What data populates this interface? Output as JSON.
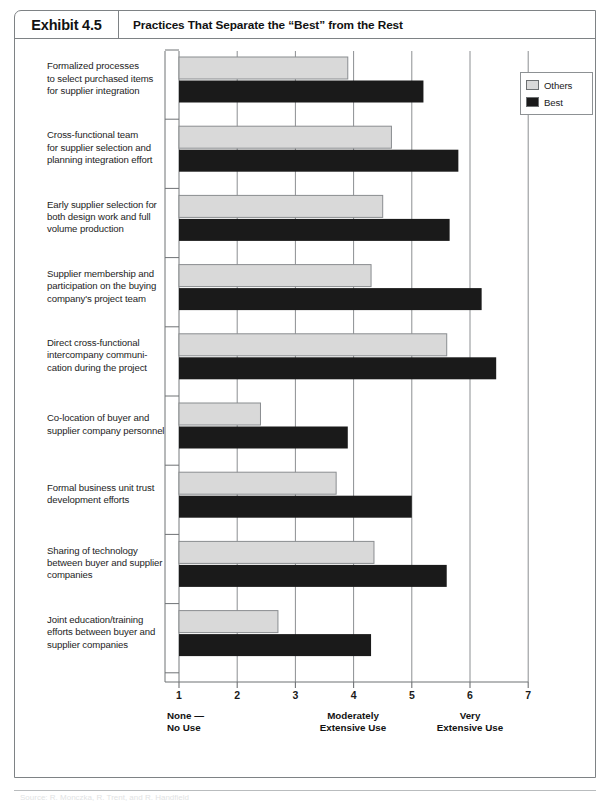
{
  "exhibit": {
    "number": "Exhibit 4.5",
    "title": "Practices That Separate the “Best” from the Rest"
  },
  "legend": {
    "items": [
      {
        "label": "Others",
        "color": "#d9d9d9"
      },
      {
        "label": "Best",
        "color": "#1a1a1a"
      }
    ]
  },
  "axis_captions": {
    "left": "None —\nNo Use",
    "center": "Moderately\nExtensive Use",
    "right": "Very\nExtensive Use"
  },
  "source": {
    "text": "Source: R. Monczka, R. Trent, and R. Handfield"
  },
  "colors": {
    "others": "#d9d9d9",
    "best": "#1a1a1a",
    "grid": "#8c8f92",
    "axis": "#6f7275",
    "frame": "#7e8285"
  },
  "chart_data": {
    "type": "bar",
    "orientation": "horizontal",
    "title": "Practices That Separate the “Best” from the Rest",
    "xlabel": "",
    "ylabel": "",
    "xlim": [
      1,
      7
    ],
    "xticks": [
      1,
      2,
      3,
      4,
      5,
      6,
      7
    ],
    "xtick_labels": [
      "1",
      "2",
      "3",
      "4",
      "5",
      "6",
      "7"
    ],
    "grid": true,
    "legend_position": "top-right",
    "categories": [
      "Formalized processes to select purchased items for supplier integration",
      "Cross-functional team for supplier selection and planning integration effort",
      "Early supplier selection for both design work and full volume production",
      "Supplier membership and participation on the buying company's project team",
      "Direct cross-functional intercompany communication during the project",
      "Co-location of buyer and supplier company personnel",
      "Formal business unit trust development efforts",
      "Sharing of technology between buyer and supplier companies",
      "Joint education/training efforts between buyer and supplier companies"
    ],
    "category_lines": [
      [
        "Formalized processes",
        "to select purchased items",
        "for supplier integration"
      ],
      [
        "Cross-functional team",
        "for supplier selection and",
        "planning integration effort"
      ],
      [
        "Early supplier selection for",
        "both design work and full",
        "volume production"
      ],
      [
        "Supplier membership and",
        "participation on the buying",
        "company's project team"
      ],
      [
        "Direct cross-functional",
        "intercompany communi-",
        "cation during the project"
      ],
      [
        "Co-location of buyer and",
        "supplier company personnel"
      ],
      [
        "Formal business unit trust",
        "development efforts"
      ],
      [
        "Sharing of technology",
        "between buyer and supplier",
        "companies"
      ],
      [
        "Joint education/training",
        "efforts between buyer and",
        "supplier companies"
      ]
    ],
    "series": [
      {
        "name": "Others",
        "color": "#d9d9d9",
        "values": [
          3.9,
          4.65,
          4.5,
          4.3,
          5.6,
          2.4,
          3.7,
          4.35,
          2.7
        ]
      },
      {
        "name": "Best",
        "color": "#1a1a1a",
        "values": [
          5.2,
          5.8,
          5.65,
          6.2,
          6.45,
          3.9,
          5.0,
          5.6,
          4.3
        ]
      }
    ]
  }
}
